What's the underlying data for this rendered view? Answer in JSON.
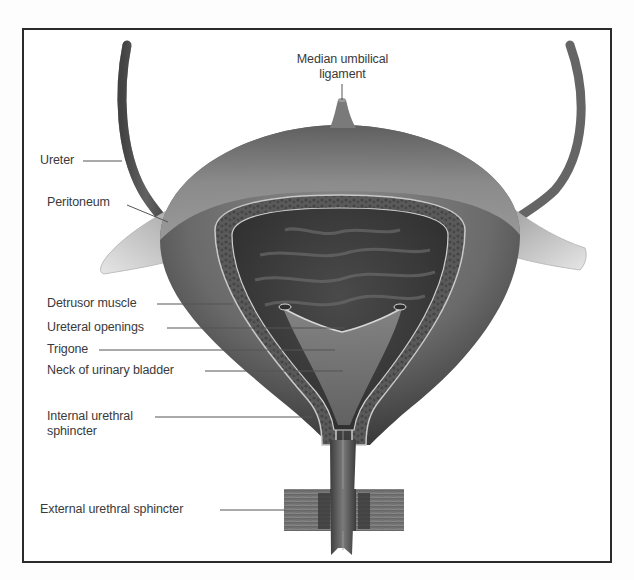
{
  "diagram": {
    "colors": {
      "frame": "#2b2b2b",
      "bladder_outer": "#6e6e6e",
      "bladder_interior": "#3e3e3e",
      "peritoneum": "#d8d8d8",
      "label_text": "#3a3a3a"
    },
    "labels": {
      "median_umbilical_ligament": [
        "Median umbilical",
        "ligament"
      ],
      "ureter": "Ureter",
      "peritoneum": "Peritoneum",
      "detrusor_muscle": "Detrusor muscle",
      "ureteral_openings": "Ureteral openings",
      "trigone": "Trigone",
      "neck_of_urinary_bladder": "Neck of urinary bladder",
      "internal_urethral_sphincter": [
        "Internal urethral",
        "sphincter"
      ],
      "external_urethral_sphincter": "External urethral sphincter"
    }
  }
}
